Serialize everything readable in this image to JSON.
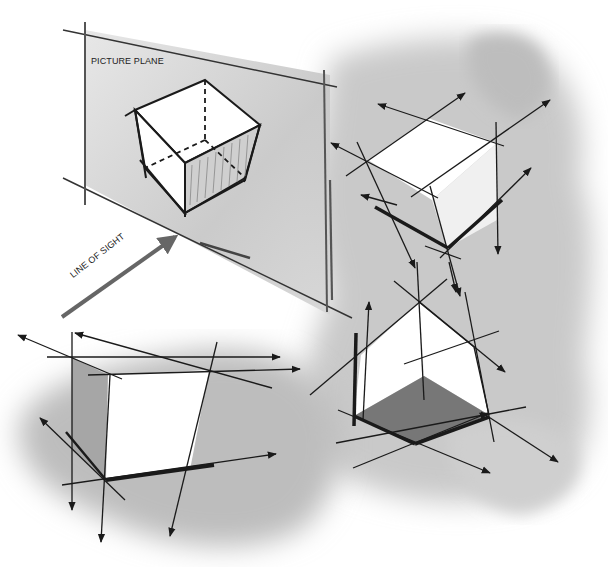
{
  "figure": {
    "labels": {
      "picture_plane": "PICTURE PLANE",
      "line_of_sight": "LINE OF SIGHT"
    },
    "panels": [
      {
        "id": "picture-plane-cube",
        "description": "Cube seen through a picture plane with line of sight arrow"
      },
      {
        "id": "top-view-cube",
        "description": "Cube viewed from above with extended perspective lines"
      },
      {
        "id": "frontal-cube",
        "description": "Cube with frontal face and extended construction lines"
      },
      {
        "id": "below-view-cube",
        "description": "Cube viewed from below with shaded bottom face"
      }
    ],
    "colors": {
      "ink": "#1a1a1a",
      "wash_light": "#d9d9d9",
      "wash_mid": "#b5b5b5",
      "shade_dark": "#7a7a7a",
      "arrow_gray": "#666666"
    }
  }
}
